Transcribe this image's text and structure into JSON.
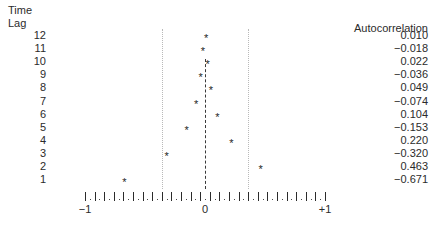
{
  "panel": {
    "lag_axis_title_line1": "Time",
    "lag_axis_title_line2": "Lag",
    "value_column_header": "Autocorrelation",
    "point_marker": "*"
  },
  "axis": {
    "left_label": "−1",
    "center_label": "0",
    "right_label": "+1",
    "min": -1,
    "max": 1,
    "zero": 0
  },
  "chart_data": {
    "type": "scatter",
    "title": "",
    "subtitle": "",
    "xlabel": "Autocorrelation",
    "ylabel": "Time Lag",
    "xlim": [
      -1,
      1
    ],
    "grid": false,
    "legend": "none",
    "zero_reference_line": 0,
    "confidence_bounds": [
      -0.36,
      0.36
    ],
    "categories": [
      12,
      11,
      10,
      9,
      8,
      7,
      6,
      5,
      4,
      3,
      2,
      1
    ],
    "lag_labels": [
      "12",
      "11",
      "10",
      "9",
      "8",
      "7",
      "6",
      "5",
      "4",
      "3",
      "2",
      "1"
    ],
    "values": [
      0.01,
      -0.018,
      0.022,
      -0.036,
      0.049,
      -0.074,
      0.104,
      -0.153,
      0.22,
      -0.32,
      0.463,
      -0.671
    ],
    "value_labels": [
      "0.010",
      "−0.018",
      "0.022",
      "−0.036",
      "0.049",
      "−0.074",
      "0.104",
      "−0.153",
      "0.220",
      "−0.320",
      "0.463",
      "−0.671"
    ],
    "axis_tick_labels": [
      "−1",
      "0",
      "+1"
    ],
    "axis_tick_values": [
      -1,
      0,
      1
    ]
  }
}
